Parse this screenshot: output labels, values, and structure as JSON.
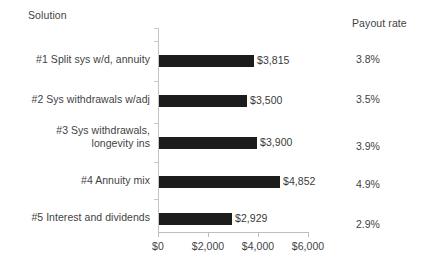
{
  "headers": {
    "left": "Solution",
    "right": "Payout rate"
  },
  "chart_data": {
    "type": "bar",
    "orientation": "horizontal",
    "title": "",
    "xlabel": "",
    "ylabel": "Solution",
    "categories": [
      "#1 Split sys w/d, annuity",
      "#2 Sys withdrawals w/adj",
      "#3  Sys withdrawals,\nlongevity ins",
      "#4 Annuity mix",
      "#5 Interest and dividends"
    ],
    "values": [
      3815,
      3500,
      3900,
      4852,
      2929
    ],
    "value_labels": [
      "$3,815",
      "$3,500",
      "$3,900",
      "$4,852",
      "$2,929"
    ],
    "payout_rates": [
      "3.8%",
      "3.5%",
      "3.9%",
      "4.9%",
      "2.9%"
    ],
    "payout_rate_values": [
      3.8,
      3.5,
      3.9,
      4.9,
      2.9
    ],
    "xlim": [
      0,
      6000
    ],
    "xticks": [
      0,
      2000,
      4000,
      6000
    ],
    "xtick_labels": [
      "$0",
      "$2,000",
      "$4,000",
      "$6,000"
    ],
    "grid": false,
    "legend": "none",
    "bar_color": "#1c1c1c",
    "axis_color": "#c4c4c4"
  },
  "geometry": {
    "plot_left": 158,
    "plot_right": 308,
    "px_per_unit": 0.025,
    "row_tops": [
      55,
      95,
      137,
      176,
      213
    ],
    "cat_label_tops": [
      53,
      93,
      124,
      174,
      211
    ],
    "payout_tops": [
      53,
      93,
      140,
      178,
      218
    ],
    "bar_height": 12
  }
}
